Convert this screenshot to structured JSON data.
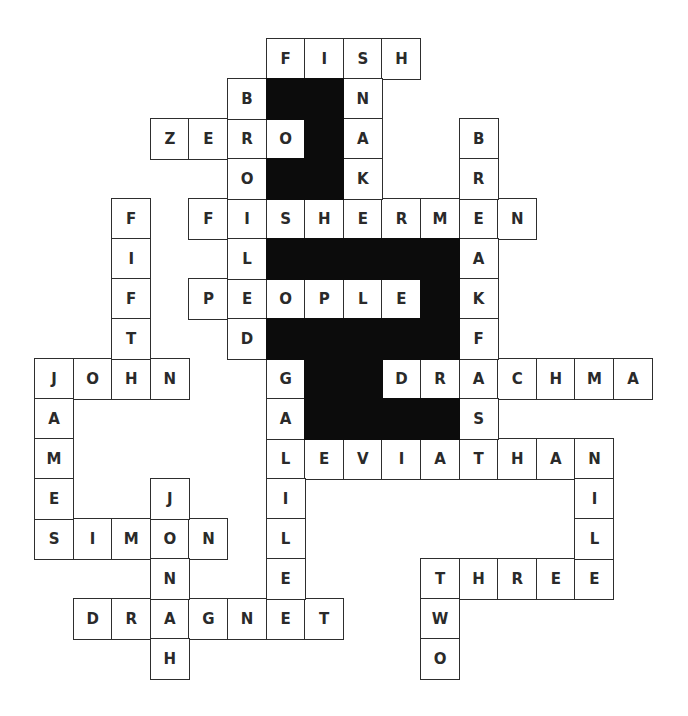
{
  "puzzle": {
    "type": "crossword",
    "grid": {
      "cols": 16,
      "rows": 16,
      "origin_x": 34,
      "origin_y": 38,
      "cell_w": 38.6,
      "cell_h": 40
    },
    "colors": {
      "line": "#2e2e2e",
      "letter": "#2a2a2a",
      "block": "#0c0c0c",
      "background": "#ffffff"
    },
    "words": [
      {
        "word": "FISH",
        "row": 0,
        "col": 6,
        "dir": "across"
      },
      {
        "word": "ZERO",
        "row": 2,
        "col": 3,
        "dir": "across"
      },
      {
        "word": "FISHERMEN",
        "row": 4,
        "col": 4,
        "dir": "across"
      },
      {
        "word": "PEOPLE",
        "row": 6,
        "col": 4,
        "dir": "across"
      },
      {
        "word": "JOHN",
        "row": 8,
        "col": 0,
        "dir": "across"
      },
      {
        "word": "DRACHMA",
        "row": 8,
        "col": 9,
        "dir": "across"
      },
      {
        "word": "LEVIATHAN",
        "row": 10,
        "col": 6,
        "dir": "across"
      },
      {
        "word": "SIMON",
        "row": 12,
        "col": 0,
        "dir": "across"
      },
      {
        "word": "THREE",
        "row": 13,
        "col": 10,
        "dir": "across"
      },
      {
        "word": "DRAGNET",
        "row": 14,
        "col": 1,
        "dir": "across"
      },
      {
        "word": "BROILED",
        "row": 1,
        "col": 5,
        "dir": "down"
      },
      {
        "word": "SNAKE",
        "row": 0,
        "col": 8,
        "dir": "down"
      },
      {
        "word": "BREAKFAST",
        "row": 2,
        "col": 11,
        "dir": "down"
      },
      {
        "word": "FIFTH",
        "row": 4,
        "col": 2,
        "dir": "down"
      },
      {
        "word": "JAMES",
        "row": 8,
        "col": 0,
        "dir": "down"
      },
      {
        "word": "GALILEE",
        "row": 8,
        "col": 6,
        "dir": "down"
      },
      {
        "word": "JONAH",
        "row": 11,
        "col": 3,
        "dir": "down"
      },
      {
        "word": "NILE",
        "row": 10,
        "col": 14,
        "dir": "down"
      },
      {
        "word": "TWO",
        "row": 13,
        "col": 10,
        "dir": "down"
      }
    ],
    "black_cells": [
      [
        1,
        6
      ],
      [
        1,
        7
      ],
      [
        2,
        7
      ],
      [
        3,
        6
      ],
      [
        3,
        7
      ],
      [
        5,
        6
      ],
      [
        5,
        7
      ],
      [
        5,
        8
      ],
      [
        5,
        9
      ],
      [
        5,
        10
      ],
      [
        6,
        10
      ],
      [
        7,
        6
      ],
      [
        7,
        7
      ],
      [
        7,
        8
      ],
      [
        7,
        9
      ],
      [
        7,
        10
      ],
      [
        8,
        7
      ],
      [
        8,
        8
      ],
      [
        9,
        7
      ],
      [
        9,
        8
      ],
      [
        9,
        9
      ],
      [
        9,
        10
      ]
    ]
  }
}
